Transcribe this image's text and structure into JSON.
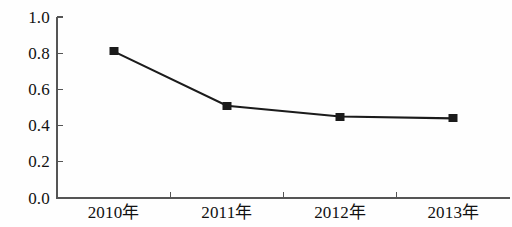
{
  "chart_data": {
    "type": "line",
    "title": "",
    "subtitle": "",
    "xlabel": "",
    "ylabel": "",
    "categories": [
      "2010年",
      "2011年",
      "2012年",
      "2013年"
    ],
    "values": [
      0.81,
      0.51,
      0.45,
      0.44
    ],
    "series": [
      {
        "name": "",
        "values": [
          0.81,
          0.51,
          0.45,
          0.44
        ]
      }
    ],
    "ylim": [
      0.0,
      1.0
    ],
    "ytick_labels": [
      "1.0",
      "0.8",
      "0.6",
      "0.4",
      "0.2",
      "0.0"
    ],
    "ytick_values": [
      1.0,
      0.8,
      0.6,
      0.4,
      0.2,
      0.0
    ],
    "grid": false,
    "legend": false,
    "legend_position": "none",
    "marker": "square",
    "marker_color": "#1b1b1b",
    "line_color": "#1b1b1b",
    "axis_color": "#555555",
    "background_color": "#fefefe"
  }
}
